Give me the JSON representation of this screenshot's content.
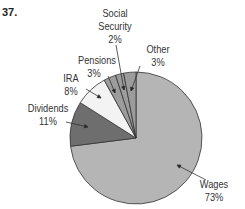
{
  "problem_number": "37.",
  "chart_data": {
    "type": "pie",
    "title": "",
    "start_angle_deg": 0,
    "direction": "clockwise-from-top for Wages; small slices counterclockwise from top",
    "slices": [
      {
        "label": "Wages",
        "value": 73,
        "display": "73%",
        "color": "#b5b5b5"
      },
      {
        "label": "Dividends",
        "value": 11,
        "display": "11%",
        "color": "#6e6e6e"
      },
      {
        "label": "IRA",
        "value": 8,
        "display": "8%",
        "color": "#f3f3f3"
      },
      {
        "label": "Pensions",
        "value": 3,
        "display": "3%",
        "color": "#9c9c9c"
      },
      {
        "label": "Social Security",
        "value": 2,
        "display": "2%",
        "color": "#9c9c9c"
      },
      {
        "label": "Other",
        "value": 3,
        "display": "3%",
        "color": "#9c9c9c"
      }
    ]
  },
  "labels": {
    "wages": {
      "name": "Wages",
      "pct": "73%"
    },
    "dividends": {
      "name": "Dividends",
      "pct": "11%"
    },
    "ira": {
      "name": "IRA",
      "pct": "8%"
    },
    "pensions": {
      "name": "Pensions",
      "pct": "3%"
    },
    "social_security": {
      "name1": "Social",
      "name2": "Security",
      "pct": "2%"
    },
    "other": {
      "name": "Other",
      "pct": "3%"
    }
  }
}
